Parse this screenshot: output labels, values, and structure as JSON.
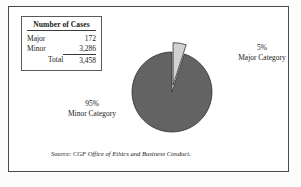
{
  "figure": {
    "source_note": "Source: CGF Office of Ethics and Business Conduct.",
    "frame_color": "#4a4a4a",
    "background_color": "#ffffff"
  },
  "table": {
    "title": "Number of Cases",
    "rows": [
      {
        "label": "Major",
        "value": "172"
      },
      {
        "label": "Minor",
        "value": "3,286"
      },
      {
        "label": "Total",
        "value": "3,458"
      }
    ]
  },
  "callouts": {
    "major": {
      "percent": "5%",
      "name": "Major Category"
    },
    "minor": {
      "percent": "95%",
      "name": "Minor Category"
    }
  },
  "chart_data": {
    "type": "pie",
    "title": "",
    "categories": [
      "Minor Category",
      "Major Category"
    ],
    "values": [
      95,
      5
    ],
    "value_labels": [
      "95%",
      "5%"
    ],
    "counts": [
      3286,
      172
    ],
    "total": 3458,
    "colors": [
      "#636363",
      "#d2d2d2"
    ],
    "slice_border_color": "#2e2e2e",
    "exploded_slices": [
      "Major Category"
    ],
    "start_angle_deg": 18,
    "legend": "none",
    "grid": false,
    "annotations": [
      "5% Major Category",
      "95% Minor Category"
    ]
  }
}
